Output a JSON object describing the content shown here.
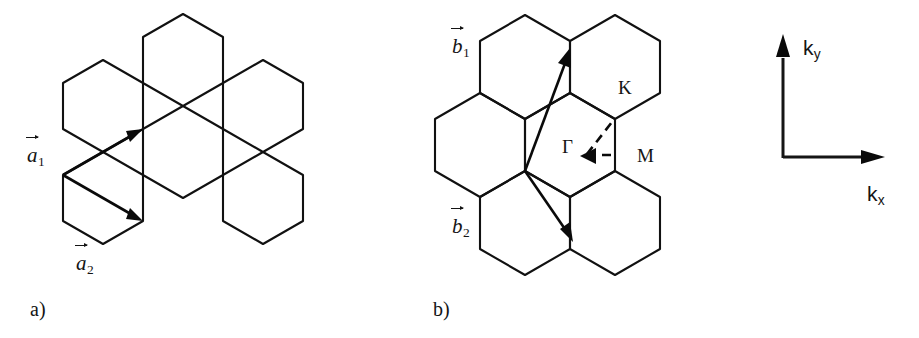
{
  "figure": {
    "background_color": "#ffffff",
    "line_color": "#111111",
    "panels": [
      {
        "id": "a",
        "caption": "a)",
        "description": "real-space honeycomb lattice with primitive vectors"
      },
      {
        "id": "b",
        "caption": "b)",
        "description": "reciprocal-space lattice with Brillouin zone high-symmetry points"
      }
    ]
  },
  "panel_a": {
    "caption": "a)",
    "vectors": [
      {
        "name": "a1",
        "label_base": "a",
        "label_sub": "1",
        "direction": "up-right"
      },
      {
        "name": "a2",
        "label_base": "a",
        "label_sub": "2",
        "direction": "down-right"
      }
    ]
  },
  "panel_b": {
    "caption": "b)",
    "vectors": [
      {
        "name": "b1",
        "label_base": "b",
        "label_sub": "1",
        "direction": "up-right"
      },
      {
        "name": "b2",
        "label_base": "b",
        "label_sub": "2",
        "direction": "down-right"
      }
    ],
    "symmetry_points": [
      {
        "name": "gamma",
        "label": "Γ"
      },
      {
        "name": "K",
        "label": "K"
      },
      {
        "name": "M",
        "label": "M"
      }
    ]
  },
  "axes": {
    "x_label_base": "k",
    "x_label_sub": "x",
    "y_label_base": "k",
    "y_label_sub": "y"
  }
}
